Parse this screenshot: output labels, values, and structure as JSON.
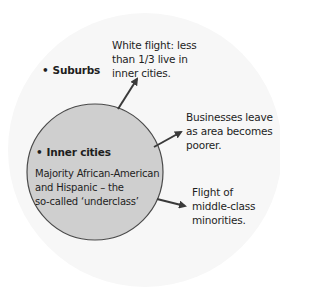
{
  "diagram": {
    "outer_region": {
      "label": "Suburbs",
      "fill": "#f6f6f6"
    },
    "inner_region": {
      "label": "Inner cities",
      "description": "Majority African-American and Hispanic – the so-called ‘underclass’",
      "description_lines": [
        "Majority African-American",
        "and Hispanic – the",
        "so-called ‘underclass’"
      ],
      "fill": "#cfcfcf",
      "stroke": "#4a4a4a"
    },
    "arrows": [
      {
        "lines": [
          "White flight: less",
          "than 1/3 live in",
          "inner cities."
        ]
      },
      {
        "lines": [
          "Businesses leave",
          "as area becomes",
          "poorer."
        ]
      },
      {
        "lines": [
          "Flight of",
          "middle-class",
          "minorities."
        ]
      }
    ],
    "arrow_color": "#3a3a3a"
  }
}
